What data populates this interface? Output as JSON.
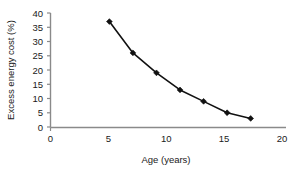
{
  "chart_data": {
    "type": "line",
    "title": "",
    "xlabel": "Age (years)",
    "ylabel": "Excess energy cost (%)",
    "xlim": [
      0,
      20
    ],
    "ylim": [
      0,
      40
    ],
    "xticks": [
      0,
      5,
      10,
      15,
      20
    ],
    "yticks": [
      0,
      5,
      10,
      15,
      20,
      25,
      30,
      35,
      40
    ],
    "xtick_labels": [
      "0",
      "5",
      "10",
      "15",
      "20"
    ],
    "ytick_labels": [
      "0",
      "5",
      "10",
      "15",
      "20",
      "25",
      "30",
      "35",
      "40"
    ],
    "grid": false,
    "legend": false,
    "marker": "diamond",
    "line_color": "#111111",
    "marker_color": "#111111",
    "axis_color": "#8a8a8a",
    "x": [
      5,
      7,
      9,
      11,
      13,
      15,
      17
    ],
    "values": [
      37,
      26,
      19,
      13,
      9,
      5,
      3
    ],
    "series": [
      {
        "name": "Excess energy cost",
        "x": [
          5,
          7,
          9,
          11,
          13,
          15,
          17
        ],
        "values": [
          37,
          26,
          19,
          13,
          9,
          5,
          3
        ]
      }
    ]
  }
}
